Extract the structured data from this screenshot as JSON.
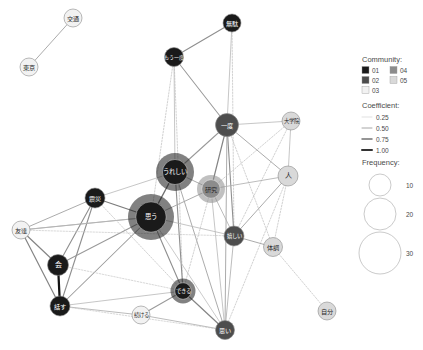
{
  "chart_data": {
    "type": "network-graph",
    "title": "",
    "nodes": [
      {
        "id": "n01",
        "label": "交通",
        "x": 73,
        "y": 18,
        "r": 9.0,
        "community": "03",
        "frequency": 4
      },
      {
        "id": "n02",
        "label": "東京",
        "x": 29,
        "y": 67,
        "r": 9.0,
        "community": "03",
        "frequency": 4
      },
      {
        "id": "n03",
        "label": "無駄",
        "x": 232,
        "y": 23,
        "r": 9.0,
        "community": "01",
        "frequency": 4
      },
      {
        "id": "n04",
        "label": "もう一度",
        "x": 174,
        "y": 57,
        "r": 9.5,
        "community": "01",
        "frequency": 5
      },
      {
        "id": "n05",
        "label": "一度",
        "x": 227,
        "y": 125,
        "r": 11.5,
        "community": "02",
        "frequency": 8
      },
      {
        "id": "n06",
        "label": "大学院",
        "x": 291,
        "y": 121,
        "r": 9.0,
        "community": "05",
        "frequency": 4
      },
      {
        "id": "n07",
        "label": "人",
        "x": 288,
        "y": 176,
        "r": 10.0,
        "community": "05",
        "frequency": 6
      },
      {
        "id": "n08",
        "label": "うれしい",
        "x": 175,
        "y": 172,
        "r": 19.0,
        "community": "01",
        "frequency": 21
      },
      {
        "id": "n09",
        "label": "研究",
        "x": 211,
        "y": 189,
        "r": 14.0,
        "community": "04",
        "frequency": 12
      },
      {
        "id": "n10",
        "label": "思う",
        "x": 151,
        "y": 217,
        "r": 23.0,
        "community": "01",
        "frequency": 30
      },
      {
        "id": "n11",
        "label": "震災",
        "x": 95,
        "y": 198,
        "r": 10.0,
        "community": "01",
        "frequency": 6
      },
      {
        "id": "n12",
        "label": "友達",
        "x": 21,
        "y": 230,
        "r": 9.0,
        "community": "03",
        "frequency": 4
      },
      {
        "id": "n13",
        "label": "嬉しい",
        "x": 234,
        "y": 236,
        "r": 10.0,
        "community": "02",
        "frequency": 6
      },
      {
        "id": "n14",
        "label": "体調",
        "x": 273,
        "y": 247,
        "r": 9.5,
        "community": "05",
        "frequency": 5
      },
      {
        "id": "n15",
        "label": "会",
        "x": 58,
        "y": 265,
        "r": 10.5,
        "community": "01",
        "frequency": 7
      },
      {
        "id": "n16",
        "label": "話す",
        "x": 60,
        "y": 306,
        "r": 10.0,
        "community": "01",
        "frequency": 6
      },
      {
        "id": "n17",
        "label": "できる",
        "x": 183,
        "y": 291,
        "r": 12.5,
        "community": "01",
        "frequency": 9
      },
      {
        "id": "n18",
        "label": "続ける",
        "x": 141,
        "y": 315,
        "r": 9.0,
        "community": "03",
        "frequency": 4
      },
      {
        "id": "n19",
        "label": "思い",
        "x": 225,
        "y": 330,
        "r": 9.5,
        "community": "02",
        "frequency": 5
      },
      {
        "id": "n20",
        "label": "自分",
        "x": 327,
        "y": 311,
        "r": 9.0,
        "community": "05",
        "frequency": 4
      }
    ],
    "edges": [
      {
        "source": "n02",
        "target": "n01",
        "coefficient": 0.3
      },
      {
        "source": "n04",
        "target": "n03",
        "coefficient": 0.4
      },
      {
        "source": "n04",
        "target": "n05",
        "coefficient": 0.35
      },
      {
        "source": "n04",
        "target": "n08",
        "coefficient": 0.22
      },
      {
        "source": "n04",
        "target": "n17",
        "coefficient": 0.18
      },
      {
        "source": "n04",
        "target": "n10",
        "coefficient": 0.18
      },
      {
        "source": "n03",
        "target": "n05",
        "coefficient": 0.22
      },
      {
        "source": "n03",
        "target": "n13",
        "coefficient": 0.18
      },
      {
        "source": "n05",
        "target": "n06",
        "coefficient": 0.22
      },
      {
        "source": "n05",
        "target": "n07",
        "coefficient": 0.3
      },
      {
        "source": "n05",
        "target": "n09",
        "coefficient": 0.45
      },
      {
        "source": "n05",
        "target": "n08",
        "coefficient": 0.35
      },
      {
        "source": "n05",
        "target": "n13",
        "coefficient": 0.4
      },
      {
        "source": "n05",
        "target": "n19",
        "coefficient": 0.3
      },
      {
        "source": "n05",
        "target": "n14",
        "coefficient": 0.18
      },
      {
        "source": "n06",
        "target": "n07",
        "coefficient": 0.22
      },
      {
        "source": "n06",
        "target": "n09",
        "coefficient": 0.18
      },
      {
        "source": "n06",
        "target": "n13",
        "coefficient": 0.18
      },
      {
        "source": "n07",
        "target": "n09",
        "coefficient": 0.25
      },
      {
        "source": "n07",
        "target": "n13",
        "coefficient": 0.3
      },
      {
        "source": "n07",
        "target": "n14",
        "coefficient": 0.18
      },
      {
        "source": "n07",
        "target": "n19",
        "coefficient": 0.18
      },
      {
        "source": "n08",
        "target": "n09",
        "coefficient": 0.3
      },
      {
        "source": "n08",
        "target": "n10",
        "coefficient": 0.55
      },
      {
        "source": "n08",
        "target": "n17",
        "coefficient": 0.4
      },
      {
        "source": "n08",
        "target": "n19",
        "coefficient": 0.3
      },
      {
        "source": "n08",
        "target": "n11",
        "coefficient": 0.22
      },
      {
        "source": "n09",
        "target": "n10",
        "coefficient": 0.3
      },
      {
        "source": "n09",
        "target": "n13",
        "coefficient": 0.25
      },
      {
        "source": "n09",
        "target": "n19",
        "coefficient": 0.22
      },
      {
        "source": "n09",
        "target": "n17",
        "coefficient": 0.18
      },
      {
        "source": "n10",
        "target": "n11",
        "coefficient": 0.5
      },
      {
        "source": "n10",
        "target": "n12",
        "coefficient": 0.3
      },
      {
        "source": "n10",
        "target": "n15",
        "coefficient": 0.35
      },
      {
        "source": "n10",
        "target": "n16",
        "coefficient": 0.35
      },
      {
        "source": "n10",
        "target": "n17",
        "coefficient": 0.4
      },
      {
        "source": "n10",
        "target": "n13",
        "coefficient": 0.22
      },
      {
        "source": "n10",
        "target": "n19",
        "coefficient": 0.2
      },
      {
        "source": "n11",
        "target": "n12",
        "coefficient": 0.3
      },
      {
        "source": "n11",
        "target": "n15",
        "coefficient": 0.4
      },
      {
        "source": "n11",
        "target": "n16",
        "coefficient": 0.4
      },
      {
        "source": "n12",
        "target": "n15",
        "coefficient": 0.45
      },
      {
        "source": "n12",
        "target": "n16",
        "coefficient": 0.45
      },
      {
        "source": "n12",
        "target": "n13",
        "coefficient": 0.15
      },
      {
        "source": "n15",
        "target": "n16",
        "coefficient": 1.0
      },
      {
        "source": "n16",
        "target": "n18",
        "coefficient": 0.25
      },
      {
        "source": "n16",
        "target": "n17",
        "coefficient": 0.22
      },
      {
        "source": "n17",
        "target": "n18",
        "coefficient": 0.35
      },
      {
        "source": "n17",
        "target": "n19",
        "coefficient": 0.45
      },
      {
        "source": "n18",
        "target": "n19",
        "coefficient": 0.25
      },
      {
        "source": "n13",
        "target": "n14",
        "coefficient": 0.3
      },
      {
        "source": "n13",
        "target": "n19",
        "coefficient": 0.25
      },
      {
        "source": "n14",
        "target": "n20",
        "coefficient": 0.18
      },
      {
        "source": "n11",
        "target": "n17",
        "coefficient": 0.18
      },
      {
        "source": "n12",
        "target": "n10",
        "coefficient": 0.2
      },
      {
        "source": "n15",
        "target": "n17",
        "coefficient": 0.15
      },
      {
        "source": "n16",
        "target": "n19",
        "coefficient": 0.15
      }
    ],
    "community_colors": {
      "01": "#1a1a1a",
      "02": "#4d4d4d",
      "03": "#f2f2f2",
      "04": "#8c8c8c",
      "05": "#d9d9d9"
    }
  },
  "legend": {
    "community": {
      "title": "Community:",
      "items": [
        {
          "label": "01",
          "color": "#1a1a1a"
        },
        {
          "label": "02",
          "color": "#4d4d4d"
        },
        {
          "label": "03",
          "color": "#f2f2f2"
        },
        {
          "label": "04",
          "color": "#8c8c8c"
        },
        {
          "label": "05",
          "color": "#d9d9d9"
        }
      ]
    },
    "coefficient": {
      "title": "Coefficient:",
      "items": [
        {
          "label": "0.25",
          "width": 0.6,
          "color": "#cccccc"
        },
        {
          "label": "0.50",
          "width": 1.0,
          "color": "#a6a6a6"
        },
        {
          "label": "0.75",
          "width": 1.5,
          "color": "#737373"
        },
        {
          "label": "1.00",
          "width": 2.0,
          "color": "#333333"
        }
      ]
    },
    "frequency": {
      "title": "Frequency:",
      "items": [
        {
          "label": "10",
          "r": 11
        },
        {
          "label": "20",
          "r": 16
        },
        {
          "label": "30",
          "r": 21
        }
      ]
    }
  }
}
